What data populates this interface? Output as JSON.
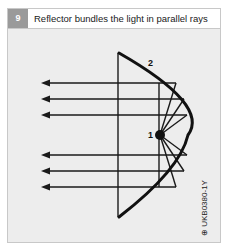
{
  "figure": {
    "number": "9",
    "title": "Reflector bundles the light in parallel rays",
    "labels": {
      "bulb": "1",
      "reflector": "2"
    },
    "image_code": "⊕ UKB0380-1Y"
  },
  "colors": {
    "number_box": "#9a9a9a",
    "background": "#ededed",
    "line": "#1a1a1a"
  }
}
